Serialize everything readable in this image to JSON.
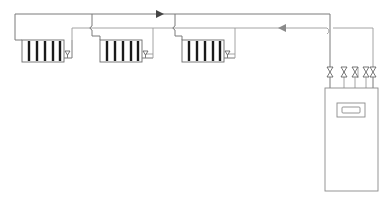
{
  "diagram": {
    "type": "two-pipe heating system schematic",
    "colors": {
      "pipe": "#7a7a7a",
      "radiator_outline": "#6a6a6a",
      "radiator_fins": "#1a1a1a",
      "boiler_outline": "#8a8a8a",
      "flow_arrow": "#444444",
      "return_arrow": "#8a8a8a",
      "background": "#ffffff"
    },
    "radiators": [
      {
        "id": "radiator-1",
        "fins": 5
      },
      {
        "id": "radiator-2",
        "fins": 5
      },
      {
        "id": "radiator-3",
        "fins": 5
      }
    ],
    "lines": [
      {
        "id": "flow-line",
        "direction": "right"
      },
      {
        "id": "return-line",
        "direction": "left"
      }
    ],
    "valves": {
      "count": 5,
      "location": "boiler inlet manifold"
    },
    "boiler": {
      "id": "boiler",
      "has_display": true
    }
  }
}
